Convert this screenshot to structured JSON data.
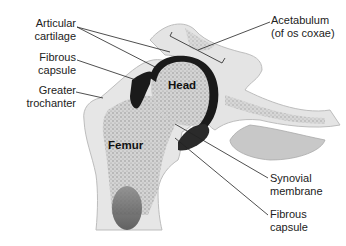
{
  "diagram": {
    "labels": {
      "articular_cartilage_1": "Articular",
      "articular_cartilage_2": "cartilage",
      "fibrous_capsule_top_1": "Fibrous",
      "fibrous_capsule_top_2": "capsule",
      "greater_trochanter_1": "Greater",
      "greater_trochanter_2": "trochanter",
      "acetabulum_1": "Acetabulum",
      "acetabulum_2": "(of os coxae)",
      "synovial_membrane_1": "Synovial",
      "synovial_membrane_2": "membrane",
      "fibrous_capsule_bottom_1": "Fibrous",
      "fibrous_capsule_bottom_2": "capsule"
    },
    "structures": {
      "head": "Head",
      "femur": "Femur"
    },
    "colors": {
      "bone_light": "#e6e6e6",
      "bone_spongy": "#b5b5b5",
      "cartilage": "#1a1a1a",
      "leader_line": "#222222",
      "text": "#222222"
    }
  }
}
